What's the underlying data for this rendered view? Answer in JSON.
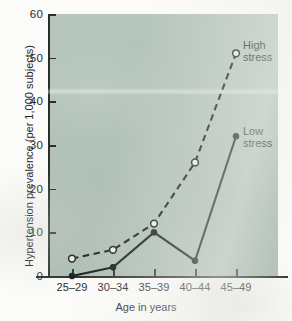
{
  "chart_data": {
    "type": "line",
    "title": "",
    "xlabel": "Age in years",
    "ylabel": "Hypertension prevalence (per 1,000 subjects)",
    "categories": [
      "25–29",
      "30–34",
      "35–39",
      "40–44",
      "45–49"
    ],
    "ylim": [
      0,
      60
    ],
    "yticks": [
      0,
      10,
      20,
      30,
      40,
      50,
      60
    ],
    "grid": false,
    "legend_position": "inline-annotations",
    "series": [
      {
        "name": "High stress",
        "values": [
          4,
          6,
          12,
          26,
          51
        ],
        "line_style": "dashed",
        "marker": "open-circle",
        "color": "#14181a"
      },
      {
        "name": "Low stress",
        "values": [
          0,
          2,
          10,
          3.5,
          32
        ],
        "line_style": "solid",
        "marker": "filled-circle",
        "color": "#14181a"
      }
    ],
    "annotations": [
      {
        "text": "High\nstress",
        "line1": "High",
        "line2": "stress"
      },
      {
        "text": "Low\nstress",
        "line1": "Low",
        "line2": "stress"
      }
    ]
  },
  "axes": {
    "y_tick_labels": [
      "60",
      "50",
      "40",
      "30",
      "20",
      "10",
      "0"
    ],
    "x_tick_labels": [
      "25–29",
      "30–34",
      "35–39",
      "40–44",
      "45–49"
    ],
    "y_title": "Hypertension prevalence (per 1,000 subjects)",
    "x_title": "Age in years"
  },
  "annotations": {
    "high_stress_line1": "High",
    "high_stress_line2": "stress",
    "low_stress_line1": "Low",
    "low_stress_line2": "stress"
  },
  "colors": {
    "panel_background": "#b2c3b9",
    "page_background": "#fbfbf9",
    "ink": "#14181a",
    "axis": "#2b2f2c"
  }
}
